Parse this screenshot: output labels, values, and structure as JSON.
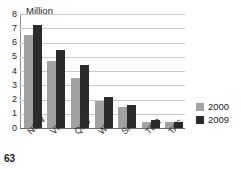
{
  "page": {
    "number": "63",
    "title_remnant": ""
  },
  "chart_data": {
    "type": "bar",
    "title": "",
    "unit_label": "Million",
    "xlabel": "",
    "ylabel": "Million",
    "ylim": [
      0,
      8
    ],
    "yticks": [
      "0",
      "1",
      "2",
      "3",
      "4",
      "5",
      "6",
      "7",
      "8"
    ],
    "grid": true,
    "legend_position": "right",
    "categories": [
      "NSW",
      "VIC",
      "QLD",
      "WA",
      "SA",
      "TER",
      "TAS"
    ],
    "series": [
      {
        "name": "2000",
        "color": "#a2a2a2",
        "values": [
          6.5,
          4.7,
          3.5,
          1.9,
          1.5,
          0.45,
          0.4
        ]
      },
      {
        "name": "2009",
        "color": "#2b2b2b",
        "values": [
          7.2,
          5.45,
          4.45,
          2.2,
          1.6,
          0.55,
          0.45
        ]
      }
    ]
  }
}
